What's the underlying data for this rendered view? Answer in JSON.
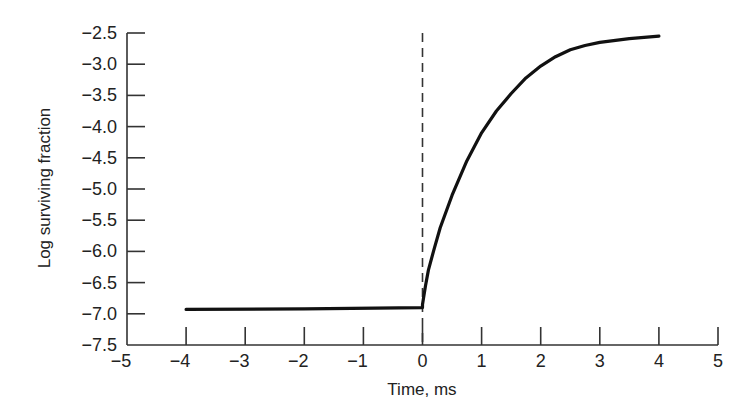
{
  "chart_data": {
    "type": "line",
    "title": "",
    "xlabel": "Time, ms",
    "ylabel": "Log surviving fraction",
    "xlim": [
      -5,
      5
    ],
    "ylim": [
      -7.5,
      -2.5
    ],
    "grid": false,
    "legend": null,
    "x_ticks": [
      -5,
      -4,
      -3,
      -2,
      -1,
      0,
      1,
      2,
      3,
      4,
      5
    ],
    "x_tick_labels": [
      "−5",
      "−4",
      "−3",
      "−2",
      "−1",
      "0",
      "1",
      "2",
      "3",
      "4",
      "5"
    ],
    "y_ticks": [
      -2.5,
      -3.0,
      -3.5,
      -4.0,
      -4.5,
      -5.0,
      -5.5,
      -6.0,
      -6.5,
      -7.0,
      -7.5
    ],
    "y_tick_labels": [
      "−2.5",
      "−3.0",
      "−3.5",
      "−4.0",
      "−4.5",
      "−5.0",
      "−5.5",
      "−6.0",
      "−6.5",
      "−7.0",
      "−7.5"
    ],
    "annotations": [
      {
        "type": "vertical-dashed-line",
        "x": 0
      }
    ],
    "series": [
      {
        "name": "surviving fraction",
        "color": "#111111",
        "x": [
          -4.0,
          -2.0,
          0.0,
          0.0,
          0.05,
          0.1,
          0.2,
          0.3,
          0.5,
          0.75,
          1.0,
          1.25,
          1.5,
          1.75,
          2.0,
          2.25,
          2.5,
          2.75,
          3.0,
          3.5,
          4.0
        ],
        "y": [
          -6.93,
          -6.92,
          -6.9,
          -6.85,
          -6.55,
          -6.3,
          -5.95,
          -5.62,
          -5.1,
          -4.55,
          -4.1,
          -3.75,
          -3.47,
          -3.22,
          -3.03,
          -2.88,
          -2.77,
          -2.7,
          -2.65,
          -2.59,
          -2.55
        ]
      }
    ]
  }
}
